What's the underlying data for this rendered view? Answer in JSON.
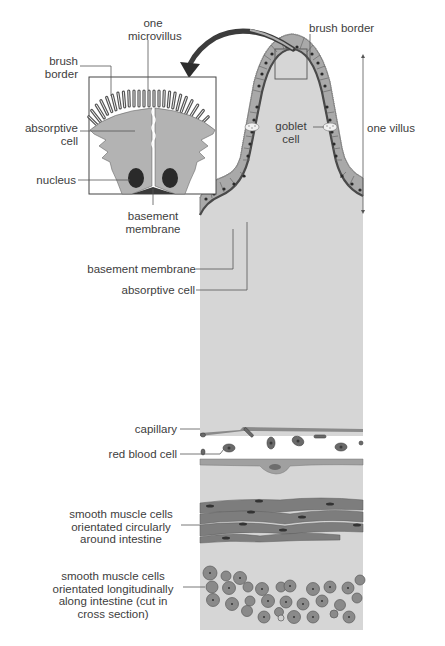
{
  "diagram": {
    "inset": {
      "labels": {
        "one_microvillus": [
          "one",
          "microvillus"
        ],
        "brush_border": [
          "brush",
          "border"
        ],
        "absorptive_cell": [
          "absorptive",
          "cell"
        ],
        "nucleus": "nucleus",
        "basement_membrane": [
          "basement",
          "membrane"
        ]
      }
    },
    "villus": {
      "labels": {
        "brush_border": "brush border",
        "goblet_cell": [
          "goblet",
          "cell"
        ],
        "one_villus": "one villus",
        "basement_membrane": "basement membrane",
        "absorptive_cell": "absorptive cell"
      }
    },
    "wall": {
      "labels": {
        "capillary": "capillary",
        "red_blood_cell": "red blood cell",
        "circular_muscle": [
          "smooth muscle cells",
          "orientated circularly",
          "around intestine"
        ],
        "longitudinal_muscle": [
          "smooth muscle cells",
          "orientated longitudinally",
          "along intestine (cut in",
          "cross section)"
        ]
      }
    },
    "colors": {
      "tissue": "#d6d6d6",
      "epithelium": "#a9a9a9",
      "membrane": "#4a4a4a",
      "nucleus": "#2a2a2a",
      "muscle": "#7d7d7d",
      "arrow": "#3c3c3c"
    }
  }
}
